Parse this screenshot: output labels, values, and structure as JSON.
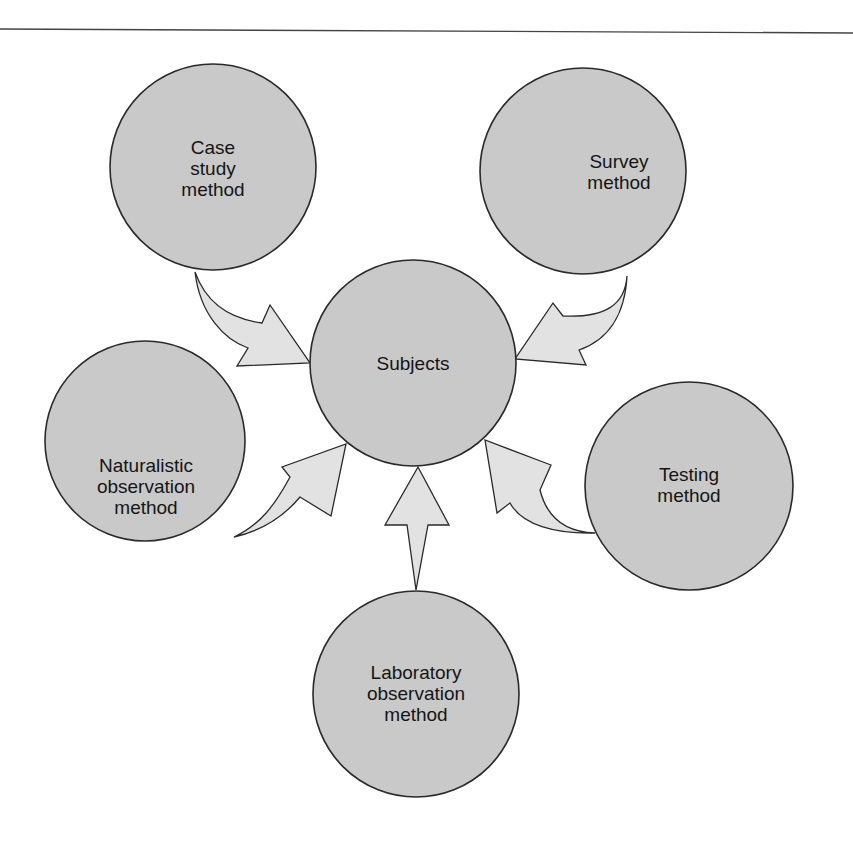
{
  "diagram": {
    "center": {
      "id": "subjects",
      "lines": [
        "Subjects"
      ]
    },
    "methods": [
      {
        "id": "case-study",
        "lines": [
          "Case",
          "study",
          "method"
        ]
      },
      {
        "id": "survey",
        "lines": [
          "Survey",
          "method"
        ]
      },
      {
        "id": "naturalistic-observation",
        "lines": [
          "Naturalistic",
          "observation",
          "method"
        ]
      },
      {
        "id": "testing",
        "lines": [
          "Testing",
          "method"
        ]
      },
      {
        "id": "laboratory-observation",
        "lines": [
          "Laboratory",
          "observation",
          "method"
        ]
      }
    ],
    "arrows": [
      {
        "from": "case-study",
        "to": "subjects"
      },
      {
        "from": "survey",
        "to": "subjects"
      },
      {
        "from": "naturalistic-observation",
        "to": "subjects"
      },
      {
        "from": "testing",
        "to": "subjects"
      },
      {
        "from": "laboratory-observation",
        "to": "subjects"
      }
    ],
    "colors": {
      "circle_fill": "#c9c9c9",
      "arrow_fill": "#e2e2e2",
      "stroke": "#2a2a2a"
    }
  }
}
